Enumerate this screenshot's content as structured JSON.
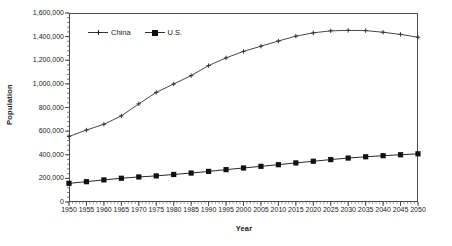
{
  "chart_data": {
    "type": "line",
    "title": "",
    "xlabel": "Year",
    "ylabel": "Population",
    "xlim": [
      1950,
      2050
    ],
    "ylim": [
      0,
      1600000
    ],
    "ytick_step": 200000,
    "grid": false,
    "legend_position": "top-left-inside",
    "x": [
      1950,
      1955,
      1960,
      1965,
      1970,
      1975,
      1980,
      1985,
      1990,
      1995,
      2000,
      2005,
      2010,
      2015,
      2020,
      2025,
      2030,
      2035,
      2040,
      2045,
      2050
    ],
    "xtick_labels": [
      "1950",
      "1955",
      "1960",
      "1965",
      "1970",
      "1975",
      "1980",
      "1985",
      "1990",
      "1995",
      "2000",
      "2005",
      "2010",
      "2015",
      "2020",
      "2025",
      "2030",
      "2035",
      "2040",
      "2045",
      "2050"
    ],
    "ytick_labels": [
      "0",
      "200,000",
      "400,000",
      "600,000",
      "800,000",
      "1,000,000",
      "1,200,000",
      "1,400,000",
      "1,600,000"
    ],
    "ytick_values": [
      0,
      200000,
      400000,
      600000,
      800000,
      1000000,
      1200000,
      1400000,
      1600000
    ],
    "series": [
      {
        "name": "China",
        "marker": "cross",
        "color": "#333333",
        "values": [
          555000,
          609000,
          658000,
          729000,
          831000,
          928000,
          999000,
          1070000,
          1155000,
          1220000,
          1275000,
          1319000,
          1363000,
          1404000,
          1432000,
          1449000,
          1453000,
          1451000,
          1437000,
          1419000,
          1395000
        ]
      },
      {
        "name": "U.S.",
        "marker": "square",
        "color": "#111111",
        "values": [
          158000,
          172000,
          187000,
          201000,
          212000,
          221000,
          233000,
          245000,
          259000,
          274000,
          288000,
          302000,
          316000,
          331000,
          345000,
          359000,
          372000,
          383000,
          392000,
          400000,
          408000
        ]
      }
    ]
  },
  "legend": {
    "entries": [
      {
        "label": "China"
      },
      {
        "label": "U.S."
      }
    ]
  }
}
